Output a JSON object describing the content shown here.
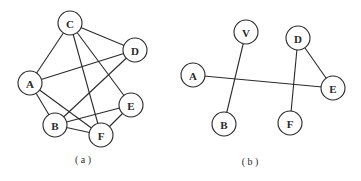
{
  "diagrams": [
    {
      "id": "a",
      "caption": "( a )",
      "caption_pos": [
        83,
        163
      ],
      "node_radius": 12,
      "nodes": [
        {
          "label": "C",
          "x": 70,
          "y": 23
        },
        {
          "label": "D",
          "x": 135,
          "y": 50
        },
        {
          "label": "A",
          "x": 30,
          "y": 83
        },
        {
          "label": "E",
          "x": 131,
          "y": 105
        },
        {
          "label": "B",
          "x": 55,
          "y": 125
        },
        {
          "label": "F",
          "x": 101,
          "y": 135
        }
      ],
      "edges": [
        [
          "C",
          "A"
        ],
        [
          "C",
          "D"
        ],
        [
          "C",
          "F"
        ],
        [
          "C",
          "E"
        ],
        [
          "A",
          "D"
        ],
        [
          "A",
          "B"
        ],
        [
          "A",
          "F"
        ],
        [
          "D",
          "B"
        ],
        [
          "B",
          "E"
        ],
        [
          "B",
          "F"
        ],
        [
          "F",
          "E"
        ]
      ]
    },
    {
      "id": "b",
      "caption": "( b )",
      "caption_pos": [
        250,
        165
      ],
      "node_radius": 12,
      "nodes": [
        {
          "label": "V",
          "x": 246,
          "y": 32
        },
        {
          "label": "D",
          "x": 298,
          "y": 38
        },
        {
          "label": "A",
          "x": 193,
          "y": 75
        },
        {
          "label": "E",
          "x": 333,
          "y": 88
        },
        {
          "label": "B",
          "x": 224,
          "y": 124
        },
        {
          "label": "F",
          "x": 290,
          "y": 123
        }
      ],
      "edges": [
        [
          "V",
          "B"
        ],
        [
          "A",
          "E"
        ],
        [
          "D",
          "F"
        ],
        [
          "D",
          "E"
        ]
      ]
    }
  ]
}
